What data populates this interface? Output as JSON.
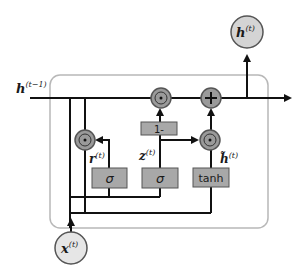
{
  "diagram": {
    "type": "GRU cell",
    "colors": {
      "node_fill": "#9a9a9a",
      "io_fill": "#d4d4d4",
      "gate_box_fill": "#a8a8a8",
      "line": "#111111",
      "cell_border": "#b8b8b8"
    },
    "inputs": {
      "h_prev": {
        "base": "h",
        "sup": "(t−1)"
      },
      "x": {
        "base": "x",
        "sup": "(t)"
      }
    },
    "outputs": {
      "h": {
        "base": "h",
        "sup": "(t)"
      }
    },
    "gates": [
      {
        "id": "reset",
        "label": "σ",
        "output": {
          "base": "r",
          "sup": "(t)"
        }
      },
      {
        "id": "update",
        "label": "σ",
        "output": {
          "base": "z",
          "sup": "(t)"
        }
      },
      {
        "id": "candidate",
        "label": "tanh",
        "output": {
          "base": "h̃",
          "sup": "(t)"
        }
      }
    ],
    "operators": {
      "one_minus": "1-",
      "hadamard": "⊙",
      "add": "+"
    }
  }
}
